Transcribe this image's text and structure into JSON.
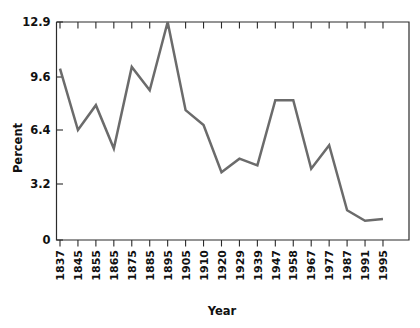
{
  "chart_data": {
    "type": "line",
    "title": "",
    "subtitle": "",
    "xlabel": "Year",
    "ylabel": "Percent",
    "categories": [
      "1837",
      "1845",
      "1855",
      "1865",
      "1875",
      "1885",
      "1895",
      "1905",
      "1910",
      "1920",
      "1929",
      "1939",
      "1947",
      "1958",
      "1967",
      "1977",
      "1987",
      "1991",
      "1995"
    ],
    "values": [
      10.1,
      6.4,
      7.9,
      5.3,
      10.2,
      8.8,
      12.9,
      7.6,
      6.7,
      3.9,
      4.7,
      4.3,
      8.2,
      8.2,
      4.1,
      5.5,
      1.7,
      1.1,
      1.2
    ],
    "series": [
      {
        "name": "Percent",
        "values": [
          10.1,
          6.4,
          7.9,
          5.3,
          10.2,
          8.8,
          12.9,
          7.6,
          6.7,
          3.9,
          4.7,
          4.3,
          8.2,
          8.2,
          4.1,
          5.5,
          1.7,
          1.1,
          1.2
        ]
      }
    ],
    "ytick_labels": [
      "0",
      "3.2",
      "6.4",
      "9.6",
      "12.9"
    ],
    "ytick_values": [
      0,
      3.2,
      6.4,
      9.6,
      12.9
    ],
    "ylim": [
      0,
      12.9
    ],
    "grid": false,
    "legend": false,
    "legend_position": "none",
    "line_color": "#6b6b6b",
    "axis_color": "#2b2b2b",
    "background_color": "#ffffff"
  },
  "axes": {
    "y_title": "Percent",
    "x_title": "Year"
  }
}
